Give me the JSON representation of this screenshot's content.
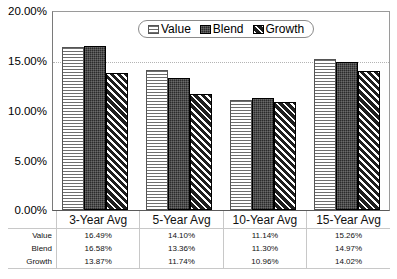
{
  "chart_data": {
    "type": "bar",
    "title": "",
    "xlabel": "",
    "ylabel": "",
    "ylim": [
      0,
      20
    ],
    "ytick_labels": [
      "20.00%",
      "15.00%",
      "10.00%",
      "5.00%",
      "0.00%"
    ],
    "ytick_values": [
      20,
      15,
      10,
      5,
      0
    ],
    "grid": true,
    "gridlines_at": [
      15
    ],
    "legend_position": "top-center",
    "categories": [
      "3-Year Avg",
      "5-Year Avg",
      "10-Year Avg",
      "15-Year Avg"
    ],
    "series": [
      {
        "name": "Value",
        "values": [
          16.49,
          14.1,
          11.14,
          15.26
        ],
        "labels": [
          "16.49%",
          "14.10%",
          "11.14%",
          "15.26%"
        ],
        "pattern": "horizontal-lines",
        "color": "#f2f2f2"
      },
      {
        "name": "Blend",
        "values": [
          16.58,
          13.36,
          11.3,
          14.97
        ],
        "labels": [
          "16.58%",
          "13.36%",
          "11.30%",
          "14.97%"
        ],
        "pattern": "solid-dark",
        "color": "#2b2b2b"
      },
      {
        "name": "Growth",
        "values": [
          13.87,
          11.74,
          10.96,
          14.02
        ],
        "labels": [
          "13.87%",
          "11.74%",
          "10.96%",
          "14.02%"
        ],
        "pattern": "diagonal-hatch",
        "color": "#1f1f1f"
      }
    ]
  },
  "legend": {
    "items": [
      {
        "label": "Value",
        "swatch": "horizontal-lines-swatch"
      },
      {
        "label": "Blend",
        "swatch": "solid-dark-swatch"
      },
      {
        "label": "Growth",
        "swatch": "diagonal-hatch-swatch"
      }
    ]
  },
  "data_table": {
    "corner": "",
    "column_headers": [
      "3-Year Avg",
      "5-Year Avg",
      "10-Year Avg",
      "15-Year Avg"
    ],
    "rows": [
      {
        "label": "Value",
        "cells": [
          "16.49%",
          "14.10%",
          "11.14%",
          "15.26%"
        ]
      },
      {
        "label": "Blend",
        "cells": [
          "16.58%",
          "13.36%",
          "11.30%",
          "14.97%"
        ]
      },
      {
        "label": "Growth",
        "cells": [
          "13.87%",
          "11.74%",
          "10.96%",
          "14.02%"
        ]
      }
    ]
  }
}
